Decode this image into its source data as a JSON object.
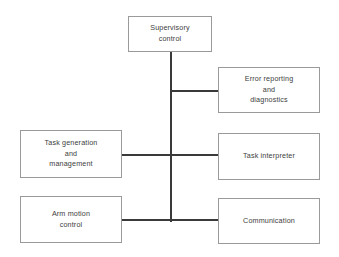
{
  "diagram": {
    "background_color": "#ffffff",
    "box_border_color": "#9a9a9a",
    "connector_color": "#3a3a3a",
    "text_color": "#3d3d3d",
    "nodes": [
      {
        "id": "supervisory",
        "label": "Supervisory\ncontrol"
      },
      {
        "id": "error_reporting",
        "label": "Error reporting\nand\ndiagnostics"
      },
      {
        "id": "task_generation",
        "label": "Task generation\nand\nmanagement"
      },
      {
        "id": "task_interpreter",
        "label": "Task interpreter"
      },
      {
        "id": "arm_motion",
        "label": "Arm motion\ncontrol"
      },
      {
        "id": "communication",
        "label": "Communication"
      }
    ],
    "connectors": [
      {
        "id": "trunk",
        "orientation": "vertical",
        "from": "supervisory",
        "to": "bus"
      },
      {
        "id": "error_branch",
        "orientation": "horizontal",
        "from": "bus",
        "to": "error_reporting"
      },
      {
        "id": "middle_branch",
        "orientation": "horizontal",
        "from": "task_generation",
        "to": "task_interpreter"
      },
      {
        "id": "bottom_branch",
        "orientation": "horizontal",
        "from": "arm_motion",
        "to": "communication"
      }
    ]
  }
}
